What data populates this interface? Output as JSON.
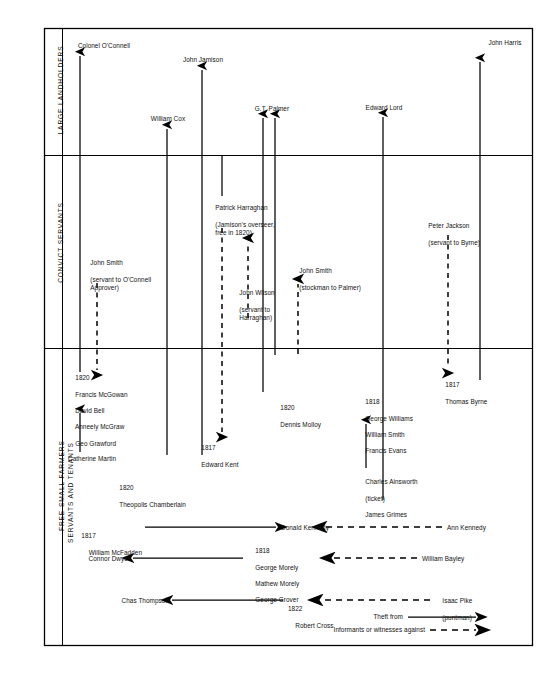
{
  "figure": {
    "type": "network-diagram",
    "title": "",
    "bands": [
      {
        "id": "large-landholders",
        "label": "LARGE LANDHOLDERS",
        "y_top": 28,
        "y_bottom": 155
      },
      {
        "id": "convict-servants",
        "label": "CONVICT SERVANTS",
        "y_top": 155,
        "y_bottom": 348
      },
      {
        "id": "free-small-farmers",
        "label": "FREE SMALL FARMERS\nSERVANTS AND TENANTS",
        "y_top": 348,
        "y_bottom": 645
      }
    ],
    "landholders": [
      {
        "name": "Colonel O'Connell",
        "x": 80
      },
      {
        "name": "John Jamison",
        "x": 202
      },
      {
        "name": "William Cox",
        "x": 167
      },
      {
        "name": "G.T. Palmer",
        "x": 269
      },
      {
        "name": "Edward Lord",
        "x": 383
      },
      {
        "name": "John Harris",
        "x": 480
      }
    ],
    "convicts": [
      {
        "name": "John Smith",
        "note": "(servant to O'Connell\nApprover)",
        "x": 97
      },
      {
        "name": "Patrick Harraghan",
        "note": "(Jamison's overseer,\nfree in 1820)",
        "x": 222
      },
      {
        "name": "John Wilson",
        "note": "(servant to\nHarraghan)",
        "x": 248
      },
      {
        "name": "John Smith",
        "note": "(stockman to Palmer)",
        "x": 298
      },
      {
        "name": "Peter Jackson",
        "note": "(servant to Byrne)",
        "x": 448
      }
    ],
    "free_groups": [
      {
        "year": "1820",
        "names": [
          "Francis McGowan",
          "David Bell",
          "Anneely McGraw",
          "Geo Grawford"
        ],
        "x": 70,
        "y": 367
      },
      {
        "name": "Catherine Martin",
        "x": 70,
        "y": 457
      },
      {
        "year": "1820",
        "names": [
          "Theopolis Chamberlain"
        ],
        "x": 114,
        "y": 479
      },
      {
        "year": "1817",
        "names": [
          "Edward Kent"
        ],
        "x": 196,
        "y": 438
      },
      {
        "year": "1820",
        "names": [
          "Dennis Molloy"
        ],
        "x": 275,
        "y": 398
      },
      {
        "year": "1818",
        "names": [
          "George Williams",
          "William Smith",
          "Francis Evans"
        ],
        "x": 360,
        "y": 392
      },
      {
        "names": [
          "Charles Ainsworth",
          "(ticket)",
          "James Grimes"
        ],
        "x": 360,
        "y": 473
      },
      {
        "year": "1817",
        "names": [
          "Thomas Byrne"
        ],
        "x": 440,
        "y": 375
      }
    ],
    "relations": [
      {
        "left": "William McFadden",
        "left_year": "1817",
        "right": "Donald Kennedy",
        "far": "Ann Kennedy",
        "y": 527
      },
      {
        "left": "Connor Dwyer",
        "right_year": "1818",
        "right": [
          "George Morely",
          "Mathew Morely",
          "George Grover"
        ],
        "far": "William Bayley",
        "y": 558
      },
      {
        "left": "Chas Thompson",
        "right_year": "1822",
        "right": "Robert Cross",
        "far": "Isaac Pike",
        "far_note": "(puntman)",
        "y": 600
      }
    ],
    "legend": [
      {
        "label": "Theft from",
        "style": "solid-arrow"
      },
      {
        "label": "Informants or witnesses against",
        "style": "dashed-arrow"
      }
    ]
  }
}
